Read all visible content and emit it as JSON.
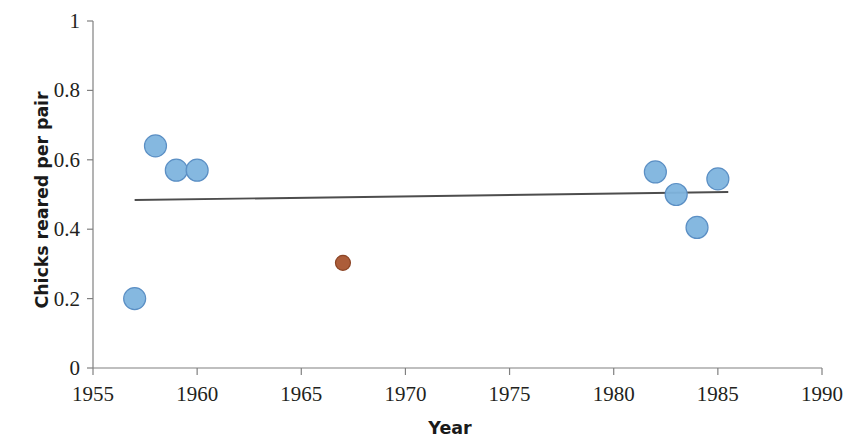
{
  "chart_data": {
    "type": "scatter",
    "title": "",
    "xlabel": "Year",
    "ylabel": "Chicks reared per pair",
    "xlim": [
      1955,
      1990
    ],
    "ylim": [
      0,
      1
    ],
    "xticks": [
      "1955",
      "1960",
      "1965",
      "1970",
      "1975",
      "1980",
      "1985",
      "1990"
    ],
    "xtick_values": [
      1955,
      1960,
      1965,
      1970,
      1975,
      1980,
      1985,
      1990
    ],
    "yticks": [
      "0",
      "0.2",
      "0.4",
      "0.6",
      "0.8",
      "1"
    ],
    "ytick_values": [
      0,
      0.2,
      0.4,
      0.6,
      0.8,
      1
    ],
    "grid": false,
    "legend": "none",
    "series": [
      {
        "name": "historic-series",
        "color": "#7eb4de",
        "edge_color": "#5b8fc4",
        "marker": "circle",
        "marker_size": 22,
        "points": [
          {
            "x": 1957,
            "y": 0.2
          },
          {
            "x": 1958,
            "y": 0.64
          },
          {
            "x": 1959,
            "y": 0.57
          },
          {
            "x": 1960,
            "y": 0.57
          },
          {
            "x": 1982,
            "y": 0.565
          },
          {
            "x": 1983,
            "y": 0.5
          },
          {
            "x": 1984,
            "y": 0.405
          },
          {
            "x": 1985,
            "y": 0.545
          }
        ]
      },
      {
        "name": "highlighted-point",
        "color": "#a8542f",
        "edge_color": "#8c4526",
        "marker": "circle",
        "marker_size": 15,
        "points": [
          {
            "x": 1967,
            "y": 0.303
          }
        ]
      }
    ],
    "trendline": {
      "name": "linear-trendline",
      "color": "#4d4d4d",
      "x_start": 1957.0,
      "y_start": 0.484,
      "x_end": 1985.5,
      "y_end": 0.507
    },
    "axis_color": "#808080"
  }
}
